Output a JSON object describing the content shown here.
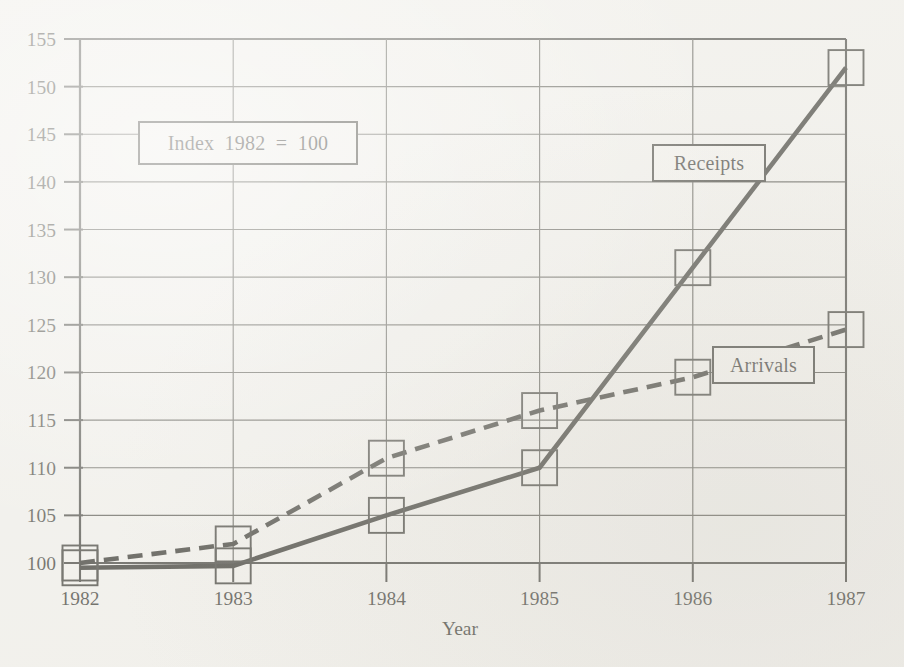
{
  "chart_data": {
    "type": "line",
    "title": "",
    "subtitle": "",
    "xlabel": "Year",
    "ylabel": "",
    "categories": [
      "1982",
      "1983",
      "1984",
      "1985",
      "1986",
      "1987"
    ],
    "x": [
      1982,
      1983,
      1984,
      1985,
      1986,
      1987
    ],
    "series": [
      {
        "name": "Arrivals",
        "style": "dashed",
        "values": [
          100,
          102,
          111,
          116,
          119.5,
          124.5
        ]
      },
      {
        "name": "Receipts",
        "style": "solid",
        "values": [
          99.5,
          99.7,
          105,
          110,
          131,
          152
        ]
      }
    ],
    "ylim": [
      100,
      155
    ],
    "xlim": [
      1982,
      1987
    ],
    "yticks": [
      100,
      105,
      110,
      115,
      120,
      125,
      130,
      135,
      140,
      145,
      150,
      155
    ],
    "ytick_labels": [
      "100",
      "105",
      "110",
      "115",
      "120",
      "125",
      "130",
      "135",
      "140",
      "145",
      "150",
      "155"
    ],
    "xticks": [
      1982,
      1983,
      1984,
      1985,
      1986,
      1987
    ],
    "xtick_labels": [
      "1982",
      "1983",
      "1984",
      "1985",
      "1986",
      "1987"
    ],
    "grid": "horizontal-and-vertical",
    "legend_position": "inline-callout-boxes",
    "annotations": [
      {
        "name": "index-note",
        "text": "Index  1982  =  100"
      },
      {
        "name": "receipts-label",
        "text": "Receipts"
      },
      {
        "name": "arrivals-label",
        "text": "Arrivals"
      }
    ],
    "marker": "open-square"
  },
  "axes": {
    "x_axis_title": "Year",
    "y_tick_labels": [
      "155",
      "150",
      "145",
      "140",
      "135",
      "130",
      "125",
      "120",
      "115",
      "110",
      "105",
      "100"
    ],
    "x_tick_labels": [
      "1982",
      "1983",
      "1984",
      "1985",
      "1986",
      "1987"
    ]
  },
  "callouts": {
    "index_note": "Index  1982  =  100",
    "receipts": "Receipts",
    "arrivals": "Arrivals"
  },
  "colors": {
    "paper": "#f2f1ed",
    "ink": "#15150f",
    "grid": "#3a3a33",
    "axis": "#24241f",
    "callout_fill": "#f4f3ef"
  }
}
